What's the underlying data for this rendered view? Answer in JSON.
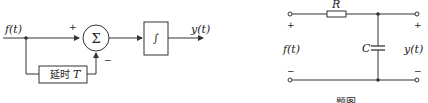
{
  "block_diagram": {
    "input_label": "f(t)",
    "output_label": "y(t)",
    "summer_symbol": "Σ",
    "plus_sign": "+",
    "minus_sign": "−",
    "delay_label": "延时",
    "delay_var": "T",
    "integrator_symbol": "∫"
  },
  "circuit": {
    "resistor_label": "R",
    "capacitor_label": "C",
    "input_label": "f(t)",
    "output_label": "y(t)",
    "plus_sign": "+",
    "minus_sign": "−"
  },
  "caption": {
    "right": "题图"
  },
  "colors": {
    "stroke": "#333333",
    "background": "#ffffff"
  }
}
